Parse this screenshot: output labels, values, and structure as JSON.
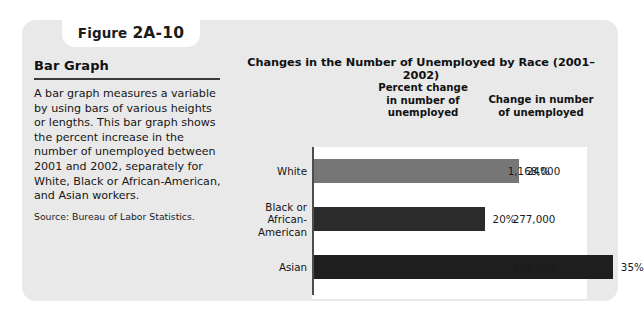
{
  "figure": {
    "label_word": "Figure",
    "label_number": "2A-10"
  },
  "left_panel": {
    "title": "Bar Graph",
    "body": "A bar graph measures a variable by using bars of various heights or lengths. This bar graph shows the percent increase in the number of unemployed between 2001 and 2002, separately for White, Black or African-American, and Asian workers.",
    "source": "Source: Bureau of Labor Statistics."
  },
  "chart_data": {
    "type": "bar",
    "orientation": "horizontal",
    "title": "Changes in the Number of Unemployed by Race (2001–2002)",
    "column_headers": [
      "Percent change\nin number of\nunemployed",
      "Change in number\nof unemployed"
    ],
    "header_percent_line1": "Percent change",
    "header_percent_line2": "in number of",
    "header_percent_line3": "unemployed",
    "header_change_line1": "Change in number",
    "header_change_line2": "of unemployed",
    "categories": [
      "White",
      "Black or African-American",
      "Asian"
    ],
    "category_label_lines": [
      [
        "White"
      ],
      [
        "Black or",
        "African-",
        "American"
      ],
      [
        "Asian"
      ]
    ],
    "values": [
      24,
      20,
      35
    ],
    "value_labels": [
      "24%",
      "20%",
      "35%"
    ],
    "absolute_change": [
      1168000,
      277000,
      101000
    ],
    "absolute_change_labels": [
      "1,168,000",
      "277,000",
      "101,000"
    ],
    "bar_colors": [
      "#767676",
      "#2b2b2b",
      "#1e1e1e"
    ],
    "xlabel": "",
    "ylabel": "",
    "xlim": [
      0,
      40
    ],
    "grid": false,
    "legend": false
  },
  "colors": {
    "card_background": "#e9e9e9",
    "page_background": "#ffffff",
    "plot_background": "#ffffff",
    "axis": "#4d4d4d",
    "text": "#111111"
  }
}
